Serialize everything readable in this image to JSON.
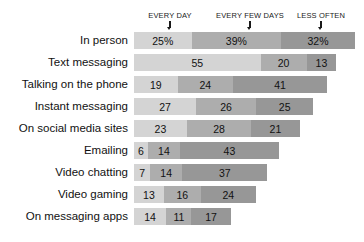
{
  "chart_data": {
    "type": "bar",
    "title": "",
    "subtitle": "",
    "xlabel": "",
    "ylabel": "",
    "stacked": true,
    "orientation": "horizontal",
    "grid": false,
    "legend_position": "top",
    "axis_note": "values are percentages; bar width proportional to value",
    "categories": [
      "In person",
      "Text messaging",
      "Talking on the phone",
      "Instant messaging",
      "On social media sites",
      "Emailing",
      "Video chatting",
      "Video gaming",
      "On messaging apps"
    ],
    "series": [
      {
        "name": "EVERY DAY",
        "color": "#d4d4d4",
        "values": [
          25,
          55,
          19,
          27,
          23,
          6,
          7,
          13,
          14
        ],
        "labels": [
          "25%",
          "55",
          "19",
          "27",
          "23",
          "6",
          "7",
          "13",
          "14"
        ]
      },
      {
        "name": "EVERY FEW DAYS",
        "color": "#adadad",
        "values": [
          39,
          20,
          24,
          26,
          28,
          14,
          14,
          16,
          11
        ],
        "labels": [
          "39%",
          "20",
          "24",
          "26",
          "28",
          "14",
          "14",
          "16",
          "11"
        ]
      },
      {
        "name": "LESS OFTEN",
        "color": "#979797",
        "values": [
          32,
          13,
          41,
          25,
          21,
          43,
          37,
          24,
          17
        ],
        "labels": [
          "32%",
          "13",
          "41",
          "25",
          "21",
          "43",
          "37",
          "24",
          "17"
        ]
      }
    ]
  },
  "headers": [
    {
      "label": "EVERY DAY",
      "icon": "down-arrow-icon"
    },
    {
      "label": "EVERY FEW DAYS",
      "icon": "down-arrow-icon"
    },
    {
      "label": "LESS OFTEN",
      "icon": "down-arrow-icon"
    }
  ]
}
